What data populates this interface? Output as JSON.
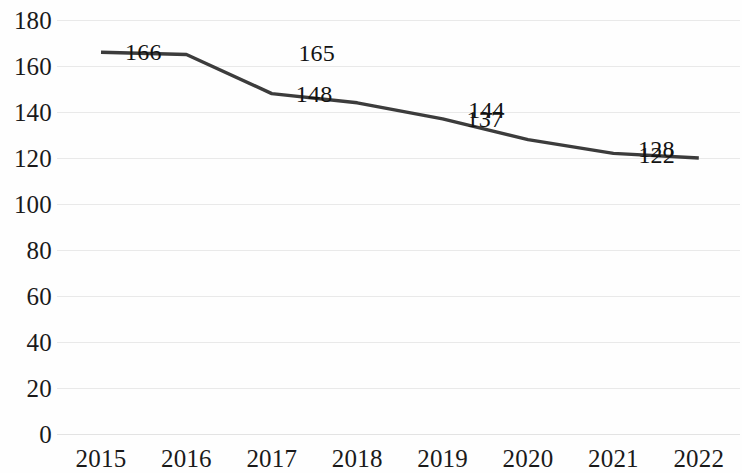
{
  "chart_data": {
    "type": "line",
    "title": "",
    "subtitle": "",
    "xlabel": "",
    "ylabel": "",
    "categories": [
      "2015",
      "2016",
      "2017",
      "2018",
      "2019",
      "2020",
      "2021",
      "2022"
    ],
    "values": [
      166,
      165,
      148,
      144,
      137,
      128,
      122,
      120
    ],
    "series": [
      {
        "name": "",
        "values": [
          166,
          165,
          148,
          144,
          137,
          128,
          122,
          120
        ],
        "color": "#3c3c3c"
      }
    ],
    "data_labels": [
      "166",
      "165",
      "148",
      "144",
      "137",
      "128",
      "122",
      "120"
    ],
    "ylim": [
      0,
      180
    ],
    "ytick_step": 20,
    "ytick_labels": [
      "0",
      "20",
      "40",
      "60",
      "80",
      "100",
      "120",
      "140",
      "160",
      "180"
    ],
    "xtick_labels": [
      "2015",
      "2016",
      "2017",
      "2018",
      "2019",
      "2020",
      "2021",
      "2022"
    ],
    "grid": "horizontal",
    "grid_color": "#e9e9e9",
    "legend": "none",
    "markers": "none",
    "background_color": "#fefefe",
    "axis_label_color": "#1a1a1a"
  }
}
